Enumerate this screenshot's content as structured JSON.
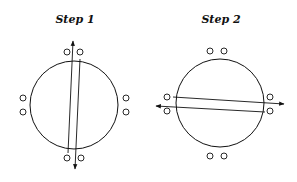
{
  "panels": [
    {
      "title": "Step 1",
      "orientation": "vertical",
      "arrows": [
        "up",
        "down"
      ]
    },
    {
      "title": "Step 2",
      "orientation": "horizontal",
      "arrows": [
        "left",
        "right"
      ]
    }
  ],
  "colors": {
    "stroke": "#111111",
    "background": "#ffffff"
  }
}
